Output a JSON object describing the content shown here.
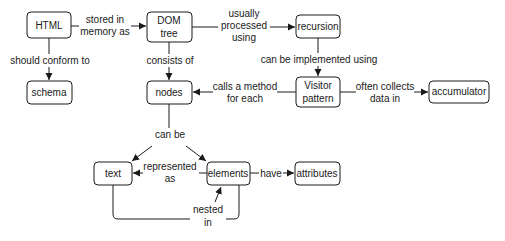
{
  "diagram": {
    "type": "concept-map",
    "nodes": [
      {
        "id": "html",
        "label": "HTML"
      },
      {
        "id": "dom",
        "label": [
          "DOM",
          "tree"
        ]
      },
      {
        "id": "recursion",
        "label": "recursion"
      },
      {
        "id": "schema",
        "label": "schema"
      },
      {
        "id": "nodes",
        "label": "nodes"
      },
      {
        "id": "visitor",
        "label": [
          "Visitor",
          "pattern"
        ]
      },
      {
        "id": "accumulator",
        "label": "accumulator"
      },
      {
        "id": "text",
        "label": "text"
      },
      {
        "id": "elements",
        "label": "elements"
      },
      {
        "id": "attributes",
        "label": "attributes"
      }
    ],
    "edges": [
      {
        "from": "html",
        "to": "dom",
        "label": [
          "stored in",
          "memory as"
        ]
      },
      {
        "from": "html",
        "to": "schema",
        "label": "should conform to"
      },
      {
        "from": "dom",
        "to": "recursion",
        "label": [
          "usually",
          "processed",
          "using"
        ]
      },
      {
        "from": "dom",
        "to": "nodes",
        "label": "consists of"
      },
      {
        "from": "recursion",
        "to": "visitor",
        "label": "can be implemented using"
      },
      {
        "from": "visitor",
        "to": "nodes",
        "label": [
          "calls a method",
          "for each"
        ]
      },
      {
        "from": "visitor",
        "to": "accumulator",
        "label": [
          "often collects",
          "data in"
        ]
      },
      {
        "from": "nodes",
        "to": [
          "text",
          "elements"
        ],
        "label": "can be"
      },
      {
        "from": "elements",
        "to": "text",
        "label": [
          "represented",
          "as"
        ]
      },
      {
        "from": "elements",
        "to": "attributes",
        "label": "have"
      },
      {
        "from": "text",
        "to": "elements",
        "label": [
          "nested",
          "in"
        ]
      }
    ]
  },
  "labels": {
    "html": "HTML",
    "dom_1": "DOM",
    "dom_2": "tree",
    "recursion": "recursion",
    "schema": "schema",
    "nodes": "nodes",
    "visitor_1": "Visitor",
    "visitor_2": "pattern",
    "accumulator": "accumulator",
    "text": "text",
    "elements": "elements",
    "attributes": "attributes",
    "e_stored_1": "stored in",
    "e_stored_2": "memory as",
    "e_conform": "should conform to",
    "e_processed_1": "usually",
    "e_processed_2": "processed",
    "e_processed_3": "using",
    "e_consists": "consists of",
    "e_implemented": "can be implemented using",
    "e_calls_1": "calls a method",
    "e_calls_2": "for each",
    "e_collects_1": "often collects",
    "e_collects_2": "data in",
    "e_canbe": "can be",
    "e_represented_1": "represented",
    "e_represented_2": "as",
    "e_have": "have",
    "e_nested_1": "nested",
    "e_nested_2": "in"
  },
  "colors": {
    "stroke": "#1a1a1a",
    "background": "#ffffff"
  }
}
